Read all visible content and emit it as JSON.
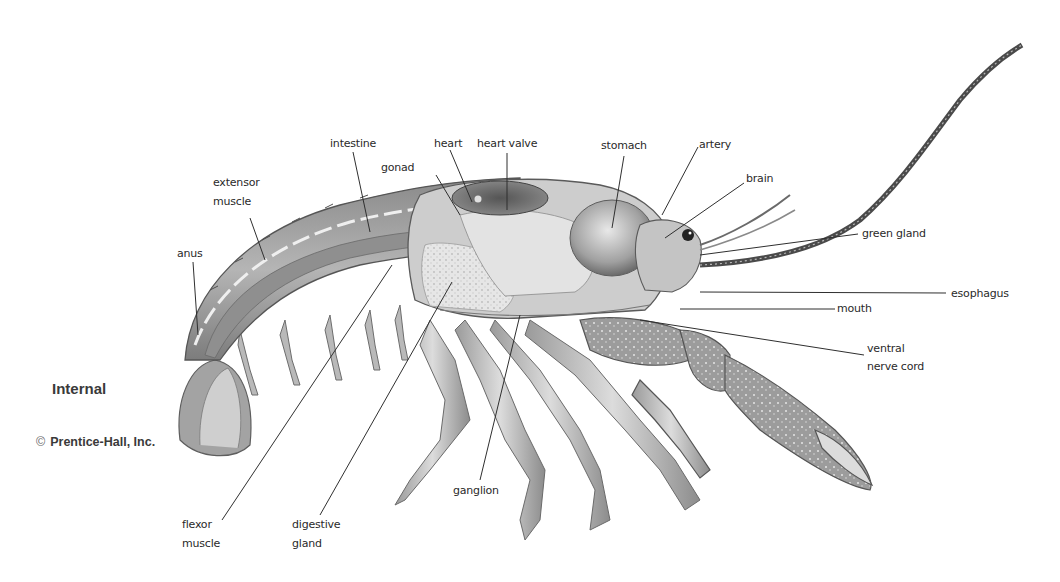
{
  "diagram": {
    "title": "Internal",
    "copyright_symbol": "©",
    "copyright": "Prentice-Hall, Inc.",
    "colors": {
      "background": "#ffffff",
      "ink": "#2a2a2a",
      "shell_dark": "#6e6e6e",
      "shell_mid": "#a8a8a8",
      "shell_light": "#d9d9d9"
    },
    "labels": {
      "intestine": "intestine",
      "heart": "heart",
      "heart_valve": "heart valve",
      "stomach": "stomach",
      "artery": "artery",
      "gonad": "gonad",
      "brain": "brain",
      "extensor_line1": "extensor",
      "extensor_line2": "muscle",
      "anus": "anus",
      "green_gland": "green gland",
      "esophagus": "esophagus",
      "mouth": "mouth",
      "ventral_line1": "ventral",
      "ventral_line2": "nerve cord",
      "flexor_line1": "flexor",
      "flexor_line2": "muscle",
      "digestive_line1": "digestive",
      "digestive_line2": "gland",
      "ganglion": "ganglion"
    }
  }
}
